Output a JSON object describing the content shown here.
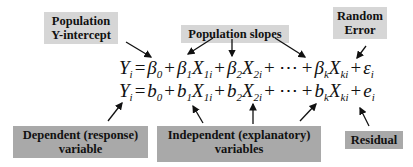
{
  "labels": {
    "population_intercept": [
      "Population",
      "Y-intercept"
    ],
    "population_slopes": "Population slopes",
    "random_error": [
      "Random",
      "Error"
    ],
    "dependent_variable": [
      "Dependent (response)",
      "variable"
    ],
    "independent_variables": [
      "Independent (explanatory)",
      "variables"
    ],
    "residual": "Residual"
  },
  "equations": {
    "population": {
      "lhs": "Y",
      "lhs_sub": "i",
      "terms": [
        {
          "coef": "β",
          "coef_sub": "0"
        },
        {
          "coef": "β",
          "coef_sub": "1",
          "var": "X",
          "var_sub": "1i"
        },
        {
          "coef": "β",
          "coef_sub": "2",
          "var": "X",
          "var_sub": "2i"
        },
        {
          "ellipsis": "⋯"
        },
        {
          "coef": "β",
          "coef_sub": "k",
          "var": "X",
          "var_sub": "ki"
        },
        {
          "coef": "ε",
          "coef_sub": "i"
        }
      ]
    },
    "sample": {
      "lhs": "Y",
      "lhs_sub": "i",
      "terms": [
        {
          "coef": "b",
          "coef_sub": "0"
        },
        {
          "coef": "b",
          "coef_sub": "1",
          "var": "X",
          "var_sub": "1i"
        },
        {
          "coef": "b",
          "coef_sub": "2",
          "var": "X",
          "var_sub": "2i"
        },
        {
          "ellipsis": "⋯"
        },
        {
          "coef": "b",
          "coef_sub": "k",
          "var": "X",
          "var_sub": "ki"
        },
        {
          "coef": "e",
          "coef_sub": "i"
        }
      ]
    }
  },
  "colors": {
    "light_box": "#d6d6d6",
    "dark_box": "#a9a9a9",
    "text": "#111111",
    "arrow": "#111111"
  }
}
